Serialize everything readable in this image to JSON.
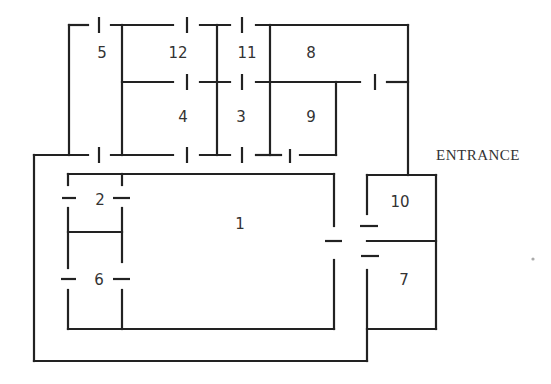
{
  "diagram": {
    "type": "floor-plan",
    "entrance_label": "ENTRANCE",
    "rooms": [
      {
        "id": "1",
        "label": "1",
        "x": 240,
        "y": 229
      },
      {
        "id": "2",
        "label": "2",
        "x": 100,
        "y": 204
      },
      {
        "id": "3",
        "label": "3",
        "x": 241,
        "y": 121
      },
      {
        "id": "4",
        "label": "4",
        "x": 183,
        "y": 121
      },
      {
        "id": "5",
        "label": "5",
        "x": 102,
        "y": 57
      },
      {
        "id": "6",
        "label": "6",
        "x": 99,
        "y": 284
      },
      {
        "id": "7",
        "label": "7",
        "x": 404,
        "y": 284
      },
      {
        "id": "8",
        "label": "8",
        "x": 311,
        "y": 57
      },
      {
        "id": "9",
        "label": "9",
        "x": 311,
        "y": 121
      },
      {
        "id": "10",
        "label": "10",
        "x": 400,
        "y": 206
      },
      {
        "id": "11",
        "label": "11",
        "x": 247,
        "y": 57
      },
      {
        "id": "12",
        "label": "12",
        "x": 178,
        "y": 57
      }
    ],
    "colors": {
      "line": "#222222",
      "text": "#333333",
      "background": "#ffffff"
    }
  }
}
